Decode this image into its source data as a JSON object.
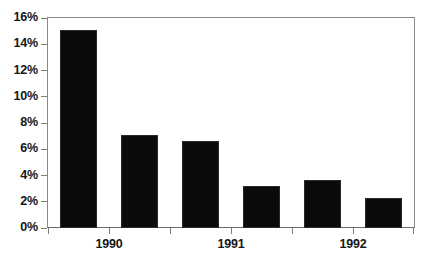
{
  "chart_data": {
    "type": "bar",
    "title": "",
    "subtitle": "",
    "xlabel": "",
    "ylabel": "",
    "categories": [
      "1990 H1",
      "1990 H2",
      "1991 H1",
      "1991 H2",
      "1992 H1",
      "1992 H2"
    ],
    "values": [
      15.1,
      7.1,
      6.6,
      3.2,
      3.65,
      2.3
    ],
    "value_suffix": "%",
    "ylim": [
      0,
      16
    ],
    "ytick_values": [
      0,
      2,
      4,
      6,
      8,
      10,
      12,
      14,
      16
    ],
    "ytick_labels": [
      "0%",
      "2%",
      "4%",
      "6%",
      "8%",
      "10%",
      "12%",
      "14%",
      "16%"
    ],
    "x_group_labels": [
      "1990",
      "1991",
      "1992"
    ],
    "bars_per_group": 2,
    "grid": false,
    "legend": false,
    "legend_position": "none",
    "bar_color": "#0b0b0b",
    "axis_color": "#8a8a8a",
    "background_color": "#ffffff",
    "series": [
      {
        "name": "series-1",
        "values": [
          15.1,
          7.1,
          6.6,
          3.2,
          3.65,
          2.3
        ]
      }
    ]
  }
}
